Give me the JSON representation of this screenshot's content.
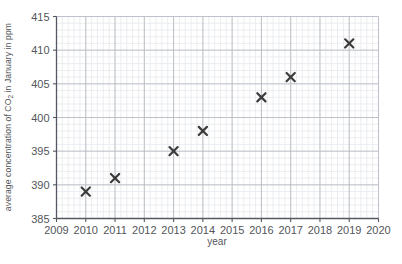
{
  "chart_data": {
    "type": "scatter",
    "title": "",
    "xlabel": "year",
    "ylabel": "average concentration of CO2 in January in ppm",
    "ylabel_parts": {
      "pre": "average concentration of CO",
      "sub": "2",
      "post": " in January in ppm"
    },
    "x": [
      2010,
      2011,
      2013,
      2014,
      2016,
      2017,
      2019
    ],
    "values": [
      389,
      391,
      395,
      398,
      403,
      406,
      411
    ],
    "points": [
      {
        "year": 2010,
        "ppm": 389
      },
      {
        "year": 2011,
        "ppm": 391
      },
      {
        "year": 2013,
        "ppm": 395
      },
      {
        "year": 2014,
        "ppm": 398
      },
      {
        "year": 2016,
        "ppm": 403
      },
      {
        "year": 2017,
        "ppm": 406
      },
      {
        "year": 2019,
        "ppm": 411
      }
    ],
    "xlim": [
      2009,
      2020
    ],
    "ylim": [
      385,
      415
    ],
    "xticks": [
      2009,
      2010,
      2011,
      2012,
      2013,
      2014,
      2015,
      2016,
      2017,
      2018,
      2019,
      2020
    ],
    "yticks": [
      385,
      390,
      395,
      400,
      405,
      410,
      415
    ],
    "xtick_labels": [
      "2009",
      "2010",
      "2011",
      "2012",
      "2013",
      "2014",
      "2015",
      "2016",
      "2017",
      "2018",
      "2019",
      "2020"
    ],
    "ytick_labels": [
      "385",
      "390",
      "395",
      "400",
      "405",
      "410",
      "415"
    ],
    "grid": true,
    "minor_grid": true,
    "minor_divisions_x": 5,
    "minor_divisions_y": 5,
    "legend": null,
    "marker": "x-cross",
    "marker_color": "#3b3b3b",
    "grid_major_color": "#b9bcc4",
    "grid_minor_color": "#e6e8ec",
    "axis_color": "#555860",
    "background_color": "#ffffff"
  }
}
